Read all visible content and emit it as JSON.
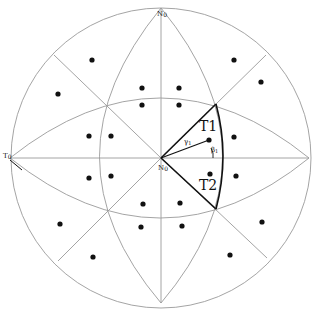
{
  "diagram": {
    "type": "spherical-triangulation",
    "labels": {
      "north": "N",
      "north_sub": "0",
      "west": "T",
      "west_sub": "0",
      "center": "N",
      "center_sub": "0",
      "tri1": "T1",
      "tri2": "T2",
      "gamma": "γ",
      "gamma_sub": "1",
      "beta": "β",
      "beta_sub": "1"
    },
    "colors": {
      "grid_line": "#9a9a9a",
      "highlight_line": "#111111",
      "dot": "#111111"
    },
    "dots": [
      [
        92,
        60
      ],
      [
        234,
        60
      ],
      [
        58,
        94
      ],
      [
        261,
        82
      ],
      [
        142,
        88
      ],
      [
        179,
        88
      ],
      [
        142,
        105
      ],
      [
        179,
        105
      ],
      [
        89,
        136
      ],
      [
        111,
        136
      ],
      [
        234,
        137
      ],
      [
        209,
        140
      ],
      [
        89,
        178
      ],
      [
        111,
        176
      ],
      [
        236,
        176
      ],
      [
        210,
        174
      ],
      [
        143,
        204
      ],
      [
        180,
        203
      ],
      [
        141,
        227
      ],
      [
        182,
        226
      ],
      [
        60,
        224
      ],
      [
        262,
        222
      ],
      [
        93,
        257
      ],
      [
        230,
        255
      ]
    ]
  }
}
